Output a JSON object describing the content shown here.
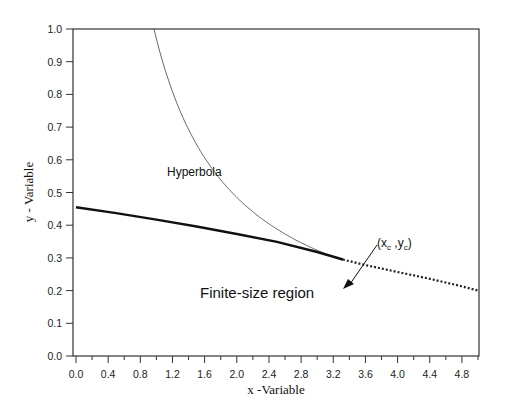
{
  "chart_data": {
    "type": "line",
    "title": "",
    "xlabel": "x -Variable",
    "ylabel": "y - Variable",
    "xlim": [
      0.0,
      5.0
    ],
    "ylim": [
      0.0,
      1.0
    ],
    "grid": false,
    "legend": null,
    "x_tick_labels": [
      "0.0",
      "0.4",
      "0.8",
      "1.2",
      "1.6",
      "2.0",
      "2.4",
      "2.8",
      "3.2",
      "3.6",
      "4.0",
      "4.4",
      "4.8"
    ],
    "y_tick_labels": [
      "0.0",
      "0.1",
      "0.2",
      "0.3",
      "0.4",
      "0.5",
      "0.6",
      "0.7",
      "0.8",
      "0.9",
      "1.0"
    ],
    "series": [
      {
        "name": "Hyperbola",
        "style": "thin-solid",
        "x": [
          0.97,
          1.2,
          1.5,
          1.8,
          2.1,
          2.4,
          2.7,
          3.0,
          3.32
        ],
        "y": [
          1.0,
          0.81,
          0.647,
          0.539,
          0.462,
          0.404,
          0.359,
          0.323,
          0.292
        ]
      },
      {
        "name": "Finite-size boundary",
        "style": "thick-solid",
        "x": [
          0.0,
          0.5,
          1.0,
          1.5,
          2.0,
          2.5,
          3.0,
          3.32
        ],
        "y": [
          0.455,
          0.437,
          0.417,
          0.396,
          0.373,
          0.349,
          0.318,
          0.295
        ]
      },
      {
        "name": "Extension",
        "style": "dotted",
        "x": [
          3.32,
          3.6,
          4.0,
          4.4,
          4.8,
          5.0
        ],
        "y": [
          0.295,
          0.278,
          0.257,
          0.236,
          0.213,
          0.2
        ]
      }
    ],
    "annotations": [
      {
        "text": "Hyperbola",
        "x": 1.15,
        "y": 0.63
      },
      {
        "text": "(x_c , y_c)",
        "x": 3.65,
        "y": 0.33,
        "arrow_to": [
          3.32,
          0.295
        ]
      },
      {
        "text": "Finite-size region",
        "x": 1.55,
        "y": 0.2
      }
    ]
  },
  "labels": {
    "hyperbola": "Hyperbola",
    "critical_x": "x",
    "critical_x_sub": "c",
    "critical_y": "y",
    "critical_y_sub": "c",
    "region": "Finite-size region",
    "xlabel": "x -Variable",
    "ylabel": "y - Variable"
  }
}
